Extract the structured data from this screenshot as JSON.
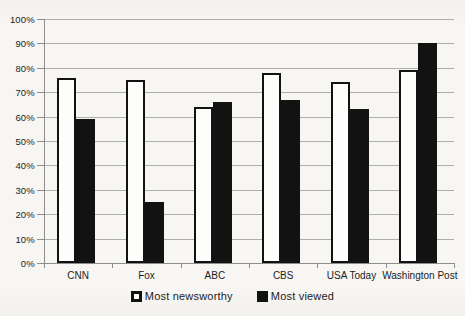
{
  "chart_data": {
    "type": "bar",
    "title": "",
    "categories": [
      "CNN",
      "Fox",
      "ABC",
      "CBS",
      "USA Today",
      "Washington Post"
    ],
    "series": [
      {
        "name": "Most newsworthy",
        "style": "light",
        "fill": "#fdfdfc",
        "border": "#121212",
        "values": [
          76,
          75,
          64,
          78,
          74,
          79
        ]
      },
      {
        "name": "Most viewed",
        "style": "dark",
        "fill": "#121212",
        "border": "#121212",
        "values": [
          59,
          25,
          66,
          67,
          63,
          90
        ]
      }
    ],
    "y_axis": {
      "min": 0,
      "max": 100,
      "step": 10,
      "tick_labels": [
        "0%",
        "10%",
        "20%",
        "30%",
        "40%",
        "50%",
        "60%",
        "70%",
        "80%",
        "90%",
        "100%"
      ]
    },
    "grid": true,
    "gridline_color": "#aeaeae",
    "axis_color": "#8d8d8d",
    "text_color": "#1c1c1c",
    "legend_position": "bottom"
  }
}
